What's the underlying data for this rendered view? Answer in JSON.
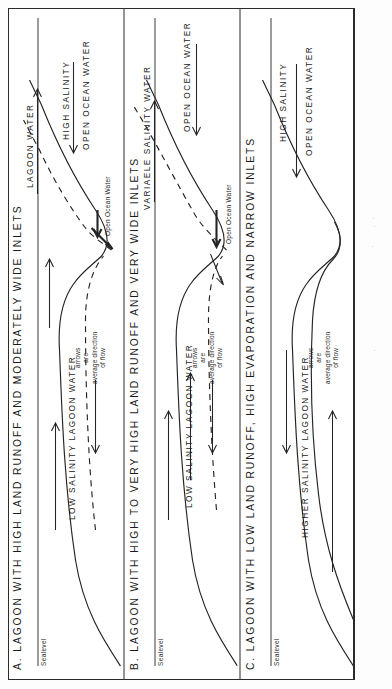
{
  "figure": {
    "caption_present": false,
    "ink_color": "#242424",
    "paper_color": "#ffffff"
  },
  "legend": {
    "line1": "arrows",
    "line2": "are",
    "line3": "average  direction",
    "line4": "of  flow"
  },
  "common": {
    "sealevel": "Sealevel",
    "open_ocean_water": "Open Ocean Water"
  },
  "panels": [
    {
      "id": "A",
      "title": "A.  LAGOON  WITH  HIGH  LAND  RUNOFF  AND  MODERATELY  WIDE  INLETS",
      "lagoon_label": "LOW   SALINITY   LAGOON   WATER",
      "outflow_label": "LAGOON   WATER",
      "ocean_label": "HIGH   SALINITY",
      "ocean_label2": "OPEN  OCEAN  WATER",
      "bottom_label": "Open Ocean Water",
      "arrows": [
        {
          "name": "lagoon-surface-outflow",
          "direction": "right"
        },
        {
          "name": "lagoon-bottom-inflow",
          "direction": "left"
        },
        {
          "name": "inlet-surface-outflow",
          "direction": "right"
        },
        {
          "name": "inlet-bottom-inflow",
          "direction": "left"
        },
        {
          "name": "ocean-outflow",
          "direction": "right"
        },
        {
          "name": "ocean-inflow",
          "direction": "left"
        }
      ]
    },
    {
      "id": "B",
      "title": "B.  LAGOON  WITH  HIGH  TO  VERY  HIGH  LAND  RUNOFF  AND  VERY  WIDE  INLETS",
      "lagoon_label": "LOW   SALINITY   LAGOON   WATER",
      "outflow_label": "VARIAELE   SALINITY   WATER",
      "ocean_label2": "OPEN  OCEAN  WATER",
      "bottom_label": "Open Ocean Water",
      "arrows": [
        {
          "name": "lagoon-surface-outflow",
          "direction": "right"
        },
        {
          "name": "lagoon-mid-outflow",
          "direction": "right"
        },
        {
          "name": "lagoon-bottom-inflow",
          "direction": "left"
        },
        {
          "name": "inlet-bottom-inflow",
          "direction": "left"
        },
        {
          "name": "ocean-outflow",
          "direction": "right"
        },
        {
          "name": "ocean-inflow",
          "direction": "left"
        }
      ]
    },
    {
      "id": "C",
      "title": "C.  LAGOON  WITH  LOW  LAND  RUNOFF,  HIGH  EVAPORATION  AND  NARROW  INLETS",
      "lagoon_label": "HIGHER   SALINITY   LAGOON   WATER",
      "ocean_label": "HIGH   SALINITY",
      "ocean_label2": "OPEN  OCEAN  WATER",
      "arrows": [
        {
          "name": "lagoon-surface-inflow",
          "direction": "left"
        },
        {
          "name": "lagoon-bottom-outflow",
          "direction": "right"
        },
        {
          "name": "ocean-inflow",
          "direction": "left"
        }
      ]
    }
  ]
}
